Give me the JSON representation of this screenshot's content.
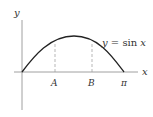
{
  "diagram": {
    "y_axis_label": "y",
    "x_axis_label": "x",
    "curve_label_lhs": "y = ",
    "curve_label_fn": "sin",
    "curve_label_var": "x",
    "ticks": {
      "a": "A",
      "b": "B",
      "pi": "π"
    },
    "colors": {
      "curve": "#222222",
      "axis": "#777777",
      "dashed": "#999999"
    }
  }
}
